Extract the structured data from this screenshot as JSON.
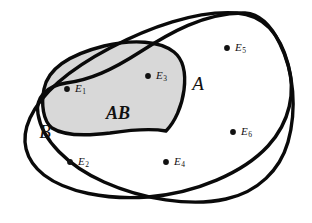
{
  "figure": {
    "name": "venn-diagram-two-sets",
    "background_color": "#ffffff",
    "outline_color": "#0a0a0a",
    "intersection_fill_color": "#d8d8d8",
    "dot_color": "#111111",
    "width": 312,
    "height": 223
  },
  "set_labels": {
    "set_a": "A",
    "set_b": "B",
    "intersection": "AB"
  },
  "elements": [
    {
      "id": "E1",
      "base": "E",
      "subscript": "1",
      "dot_x": 67,
      "dot_y": 89,
      "label_x": 75,
      "label_y": 89,
      "region": "AB"
    },
    {
      "id": "E2",
      "base": "E",
      "subscript": "2",
      "dot_x": 70,
      "dot_y": 162,
      "label_x": 78,
      "label_y": 162,
      "region": "B"
    },
    {
      "id": "E3",
      "base": "E",
      "subscript": "3",
      "dot_x": 148,
      "dot_y": 76,
      "label_x": 156,
      "label_y": 76,
      "region": "AB"
    },
    {
      "id": "E4",
      "base": "E",
      "subscript": "4",
      "dot_x": 166,
      "dot_y": 162,
      "label_x": 174,
      "label_y": 162,
      "region": "B"
    },
    {
      "id": "E5",
      "base": "E",
      "subscript": "5",
      "dot_x": 227,
      "dot_y": 48,
      "label_x": 235,
      "label_y": 48,
      "region": "A"
    },
    {
      "id": "E6",
      "base": "E",
      "subscript": "6",
      "dot_x": 233,
      "dot_y": 132,
      "label_x": 241,
      "label_y": 132,
      "region": "A"
    }
  ],
  "label_positions": {
    "set_a": {
      "x": 198,
      "y": 86
    },
    "set_b": {
      "x": 45,
      "y": 134
    },
    "intersection": {
      "x": 118,
      "y": 115
    }
  },
  "geometry": {
    "set_a_path": "M 245 13 C 205 12 168 34 140 52 C 112 70 90 80 66 83 C 46 86 35 98 38 114 C 42 140 68 166 104 182 C 142 199 190 207 226 199 C 258 192 280 170 288 142 C 297 110 294 72 280 44 C 271 25 260 14 245 13 Z",
    "set_b_path": "M 237 13 C 196 10 148 28 110 48 C 72 68 42 92 30 118 C 20 140 25 160 44 175 C 66 192 106 200 148 197 C 196 193 243 173 268 146 C 290 122 296 92 288 64 C 280 34 263 15 237 13 Z",
    "intersection_path": "M 44 89 C 48 68 72 54 104 46 C 134 39 160 41 174 52 C 184 60 186 74 184 90 C 182 106 175 122 166 131 C 150 128 130 130 110 133 C 86 136 64 136 52 128 C 43 121 41 104 44 89 Z"
  }
}
